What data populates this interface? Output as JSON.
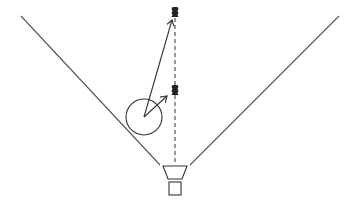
{
  "diagram": {
    "type": "sensor-field-of-view",
    "colors": {
      "background": "#ffffff",
      "cone_line": "#555555",
      "stroke": "#333333",
      "target": "#222222"
    },
    "elements": {
      "sensor": {
        "shape": "horn-on-box",
        "label": ""
      },
      "cone": {
        "left_edge": [
          [
            21,
            16
          ],
          [
            160,
            165
          ]
        ],
        "right_edge": [
          [
            339,
            16
          ],
          [
            190,
            165
          ]
        ]
      },
      "center_axis": {
        "style": "dashed",
        "x": 175,
        "y_from": 18,
        "y_to": 165
      },
      "targets": [
        {
          "name": "far-target",
          "x": 175,
          "y": 12
        },
        {
          "name": "near-target",
          "x": 175,
          "y": 90
        }
      ],
      "object": {
        "shape": "circle",
        "cx": 144,
        "cy": 117,
        "r": 18
      },
      "arrows": [
        {
          "name": "arrow-to-far-target",
          "from": [
            144,
            117
          ],
          "to": [
            172,
            20
          ]
        },
        {
          "name": "arrow-to-near-target",
          "from": [
            144,
            117
          ],
          "to": [
            167,
            96
          ]
        }
      ]
    }
  }
}
